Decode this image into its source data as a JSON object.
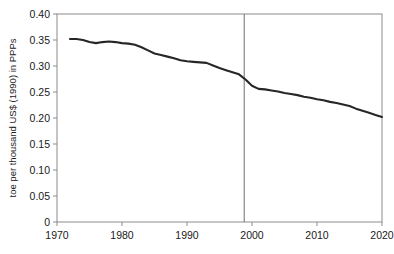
{
  "chart_data": {
    "type": "line",
    "title": "",
    "xlabel": "",
    "ylabel": "toe per thousand US$ (1990) in PPPs",
    "xlim": [
      1970,
      2020
    ],
    "ylim": [
      0,
      0.4
    ],
    "grid": false,
    "legend": null,
    "x_ticks": [
      "1970",
      "1980",
      "1990",
      "2000",
      "2010",
      "2020"
    ],
    "x_tick_values": [
      1970,
      1980,
      1990,
      2000,
      2010,
      2020
    ],
    "y_ticks": [
      "0",
      "0.05",
      "0.10",
      "0.15",
      "0.20",
      "0.25",
      "0.30",
      "0.35",
      "0.40"
    ],
    "y_tick_values": [
      0,
      0.05,
      0.1,
      0.15,
      0.2,
      0.25,
      0.3,
      0.35,
      0.4
    ],
    "series": [
      {
        "name": "energy intensity",
        "color": "#262626",
        "x": [
          1972,
          1973,
          1974,
          1975,
          1976,
          1977,
          1978,
          1979,
          1980,
          1981,
          1982,
          1983,
          1984,
          1985,
          1986,
          1987,
          1988,
          1989,
          1990,
          1991,
          1992,
          1993,
          1994,
          1995,
          1996,
          1997,
          1998,
          1999,
          2000,
          2001,
          2002,
          2003,
          2004,
          2005,
          2006,
          2007,
          2008,
          2009,
          2010,
          2011,
          2012,
          2013,
          2014,
          2015,
          2016,
          2017,
          2018,
          2019,
          2020
        ],
        "values": [
          0.352,
          0.352,
          0.35,
          0.346,
          0.344,
          0.346,
          0.347,
          0.346,
          0.344,
          0.343,
          0.341,
          0.336,
          0.33,
          0.324,
          0.321,
          0.318,
          0.315,
          0.311,
          0.309,
          0.308,
          0.307,
          0.306,
          0.301,
          0.296,
          0.292,
          0.288,
          0.284,
          0.274,
          0.262,
          0.256,
          0.255,
          0.253,
          0.251,
          0.248,
          0.246,
          0.244,
          0.241,
          0.239,
          0.236,
          0.234,
          0.231,
          0.229,
          0.226,
          0.223,
          0.218,
          0.214,
          0.21,
          0.206,
          0.202
        ]
      }
    ],
    "annotations": [
      {
        "name": "projection-divider",
        "type": "vline",
        "x": 1998.8,
        "color": "#6e6e6e"
      }
    ],
    "frame_color": "#8c8c8c",
    "line_color": "#262626"
  }
}
